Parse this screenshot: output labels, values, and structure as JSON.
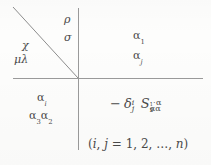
{
  "figure": {
    "type": "four-quadrant index diagram",
    "axes": {
      "horizontal_color": "#9a9a9a",
      "vertical_color": "#9a9a9a",
      "diagonal_color": "#8d8d8d"
    },
    "quadrants": {
      "upper_left": {
        "labels": [
          {
            "text": "χ",
            "name": "chi"
          },
          {
            "text": "μλ",
            "name": "mu-lambda"
          }
        ]
      },
      "upper_left_inner": {
        "labels": [
          {
            "text": "ρ",
            "name": "rho"
          },
          {
            "text": "σ",
            "name": "sigma"
          }
        ]
      },
      "upper_right": {
        "alpha_base": "α",
        "sub_1": "1",
        "sub_j": "j"
      },
      "lower_left": {
        "alpha_base": "α",
        "sub_i": "i",
        "sub_3": "3",
        "sub_2": "2"
      },
      "lower_right": {
        "minus": "−",
        "delta": "δ",
        "delta_sup": "i",
        "delta_sub": "j",
        "s": "S",
        "s_sup_dots": "··",
        "s_sup_alpha": "α",
        "s_sup_alpha_sub": "1",
        "s_sub_alpha_a": "α",
        "s_sub_alpha_a_sub": "3",
        "s_sub_alpha_b": "α",
        "s_sub_alpha_b_sub": "2"
      }
    },
    "range_note": {
      "open_paren": "(",
      "i": "i",
      "comma1": ",",
      "j": "j",
      "equals": "=",
      "one": "1,",
      "two": "2,",
      "ellipsis": "…,",
      "n": "n",
      "close_paren": ")"
    }
  }
}
